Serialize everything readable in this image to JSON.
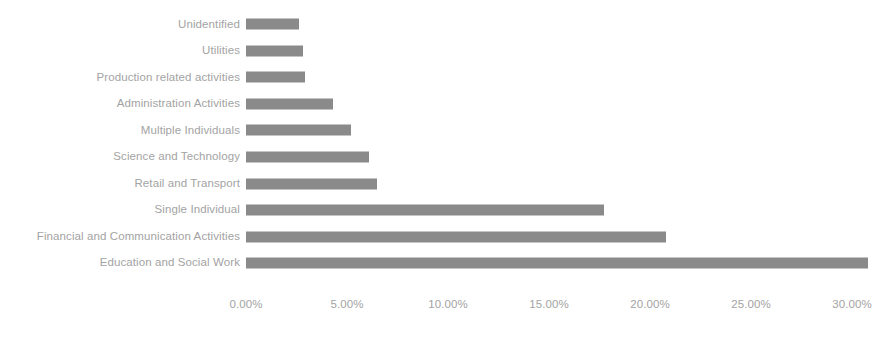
{
  "chart_data": {
    "type": "bar",
    "orientation": "horizontal",
    "title": "",
    "subtitle": "",
    "xlabel": "",
    "ylabel": "",
    "grid": false,
    "legend": false,
    "xlim": [
      0,
      30.8
    ],
    "axis_ticks": [
      "0.00%",
      "5.00%",
      "10.00%",
      "15.00%",
      "20.00%",
      "25.00%",
      "30.00%"
    ],
    "axis_tick_values": [
      0,
      5,
      10,
      15,
      20,
      25,
      30
    ],
    "bar_color": "#8a8a8a",
    "label_color": "#a3a3a3",
    "background_color": "#ffffff",
    "categories": [
      "Unidentified",
      "Utilities",
      "Production related activities",
      "Administration Activities",
      "Multiple Individuals",
      "Science and Technology",
      "Retail and Transport",
      "Single Individual",
      "Financial and Communication Activities",
      "Education and Social Work"
    ],
    "values": [
      2.6,
      2.8,
      2.9,
      4.3,
      5.2,
      6.1,
      6.5,
      17.7,
      20.8,
      30.8
    ],
    "value_labels": [
      "2.60%",
      "2.80%",
      "2.90%",
      "4.30%",
      "5.20%",
      "6.10%",
      "6.50%",
      "17.70%",
      "20.80%",
      "30.80%"
    ]
  }
}
